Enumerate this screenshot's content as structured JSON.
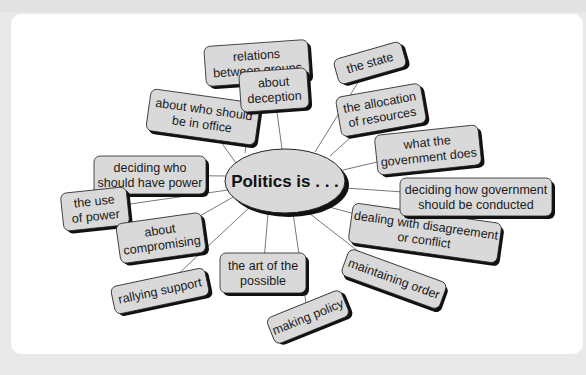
{
  "diagram": {
    "center": {
      "label": "Politics is . . .",
      "x": 285,
      "y": 181,
      "rx": 60,
      "ry": 32
    },
    "colors": {
      "node_fill": "#d9d9d9",
      "node_stroke": "#222222",
      "shadow": "#111111",
      "line": "#555555",
      "background": "#e9e9e9",
      "card": "#ffffff"
    },
    "nodes": [
      {
        "id": "relations",
        "lines": [
          "relations",
          "between groups"
        ],
        "x": 205,
        "y": 43,
        "w": 104,
        "h": 40,
        "rot": -4,
        "ax": 245,
        "ay": 153
      },
      {
        "id": "who-office",
        "lines": [
          "about who should",
          "be in office"
        ],
        "x": 148,
        "y": 96,
        "w": 110,
        "h": 42,
        "rot": 8,
        "ax": 236,
        "ay": 163
      },
      {
        "id": "decide-power",
        "lines": [
          "deciding who",
          "should have power"
        ],
        "x": 94,
        "y": 156,
        "w": 112,
        "h": 38,
        "rot": 0,
        "ax": 225,
        "ay": 176
      },
      {
        "id": "use-power",
        "lines": [
          "the use",
          "of power"
        ],
        "x": 62,
        "y": 190,
        "w": 66,
        "h": 38,
        "rot": -6,
        "ax": 228,
        "ay": 190
      },
      {
        "id": "compromising",
        "lines": [
          "about",
          "compromising"
        ],
        "x": 118,
        "y": 218,
        "w": 86,
        "h": 40,
        "rot": -8,
        "ax": 235,
        "ay": 196
      },
      {
        "id": "rallying",
        "lines": [
          "rallying support"
        ],
        "x": 112,
        "y": 277,
        "w": 96,
        "h": 28,
        "rot": -12,
        "ax": 250,
        "ay": 207
      },
      {
        "id": "art-possible",
        "lines": [
          "the art of the",
          "possible"
        ],
        "x": 220,
        "y": 253,
        "w": 86,
        "h": 40,
        "rot": 0,
        "ax": 268,
        "ay": 213
      },
      {
        "id": "making-policy",
        "lines": [
          "making policy"
        ],
        "x": 268,
        "y": 303,
        "w": 80,
        "h": 28,
        "rot": -22,
        "ax": 293,
        "ay": 213
      },
      {
        "id": "maintaining-order",
        "lines": [
          "maintaining order"
        ],
        "x": 342,
        "y": 265,
        "w": 104,
        "h": 28,
        "rot": 20,
        "ax": 305,
        "ay": 210
      },
      {
        "id": "disagreement",
        "lines": [
          "dealing with disagreement",
          "or conflict"
        ],
        "x": 350,
        "y": 213,
        "w": 150,
        "h": 40,
        "rot": 8,
        "ax": 318,
        "ay": 204
      },
      {
        "id": "govt-conducted",
        "lines": [
          "deciding how government",
          "should be conducted"
        ],
        "x": 400,
        "y": 178,
        "w": 152,
        "h": 38,
        "rot": 0,
        "ax": 345,
        "ay": 188
      },
      {
        "id": "govt-does",
        "lines": [
          "what the",
          "government does"
        ],
        "x": 376,
        "y": 130,
        "w": 104,
        "h": 40,
        "rot": -6,
        "ax": 343,
        "ay": 170
      },
      {
        "id": "allocation",
        "lines": [
          "the allocation",
          "of resources"
        ],
        "x": 338,
        "y": 90,
        "w": 86,
        "h": 40,
        "rot": -10,
        "ax": 330,
        "ay": 156
      },
      {
        "id": "state",
        "lines": [
          "the state"
        ],
        "x": 335,
        "y": 50,
        "w": 70,
        "h": 26,
        "rot": -16,
        "ax": 315,
        "ay": 152
      },
      {
        "id": "deception",
        "lines": [
          "about",
          "deception"
        ],
        "x": 240,
        "y": 70,
        "w": 68,
        "h": 40,
        "rot": -4,
        "ax": 282,
        "ay": 149
      }
    ]
  }
}
